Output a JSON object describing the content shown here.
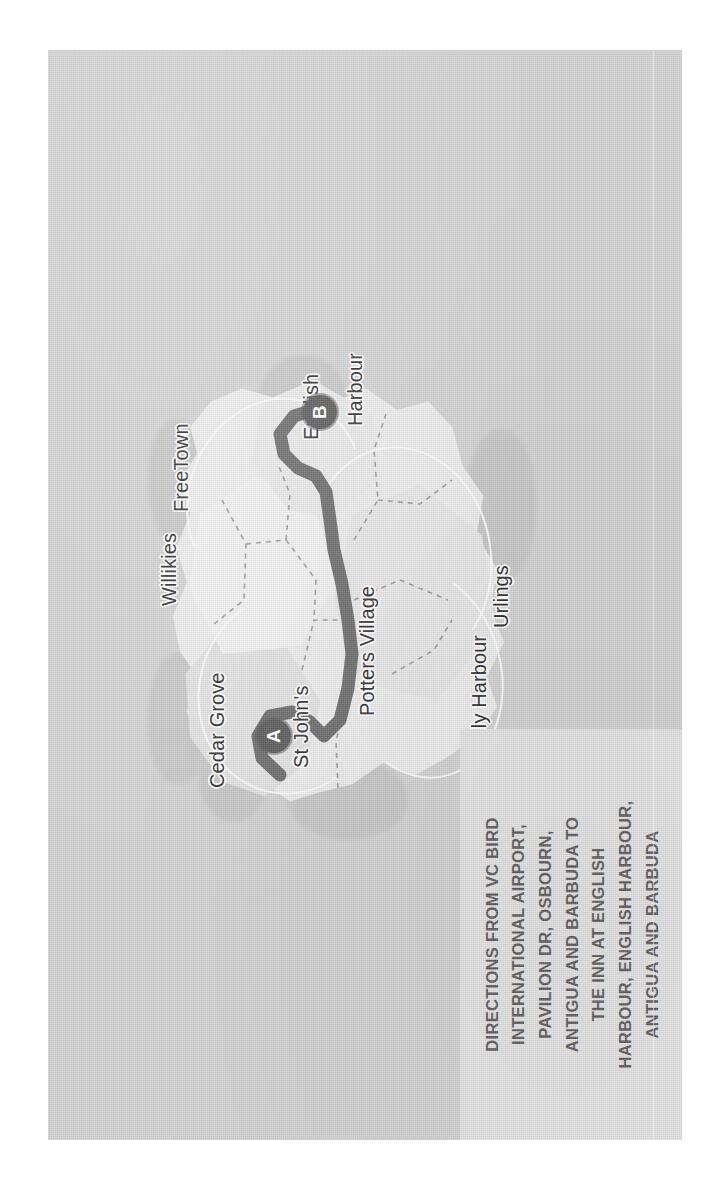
{
  "document": {
    "kind": "scanned-directions-map",
    "orientation": "rotated-90-ccw",
    "sheet_color": "#d2d2d2",
    "land_color": "#ececec",
    "route_color": "#6b6b6b",
    "marker_color": "#595959",
    "label_color": "#2b2b2b",
    "caption_bg": "#e4e4e4",
    "caption_color": "#5d5d5d"
  },
  "caption": {
    "lines": [
      "DIRECTIONS FROM VC BIRD",
      "INTERNATIONAL AIRPORT,",
      "PAVILION DR, OSBOURN,",
      "ANTIGUA AND BARBUDA TO",
      "THE INN AT ENGLISH",
      "HARBOUR, ENGLISH HARBOUR,",
      "ANTIGUA AND BARBUDA"
    ]
  },
  "map": {
    "labels": [
      {
        "name": "cedar-grove",
        "text": "Cedar Grove",
        "x": 352,
        "y": 168
      },
      {
        "name": "st-johns",
        "text": "St John's",
        "x": 372,
        "y": 252
      },
      {
        "name": "potters-village",
        "text": "Potters Village",
        "x": 432,
        "y": 318
      },
      {
        "name": "jolly-harbour",
        "text": "Jolly Harbour",
        "x": 392,
        "y": 430
      },
      {
        "name": "urlings",
        "text": "Urlings",
        "x": 508,
        "y": 452
      },
      {
        "name": "willikies",
        "text": "Willikies",
        "x": 538,
        "y": 120
      },
      {
        "name": "free-town",
        "text": "FreeTown",
        "x": 630,
        "y": 132
      },
      {
        "name": "english",
        "text": "English",
        "x": 708,
        "y": 262
      },
      {
        "name": "harbour",
        "text": "Harbour",
        "x": 726,
        "y": 306
      }
    ],
    "markers": [
      {
        "name": "marker-a",
        "letter": "A",
        "x": 404,
        "y": 226,
        "place": "VC Bird International Airport"
      },
      {
        "name": "marker-b",
        "letter": "B",
        "x": 728,
        "y": 272,
        "place": "The Inn at English Harbour"
      }
    ],
    "route": {
      "name": "driving-route",
      "from": "A",
      "to": "B",
      "points": "365,232 382,214 404,210 424,222 428,244 418,262 404,276 420,292 452,300 486,304 520,300 556,294 590,286 620,282 648,278 664,268 672,250 686,236 706,232 724,246 730,266"
    }
  }
}
